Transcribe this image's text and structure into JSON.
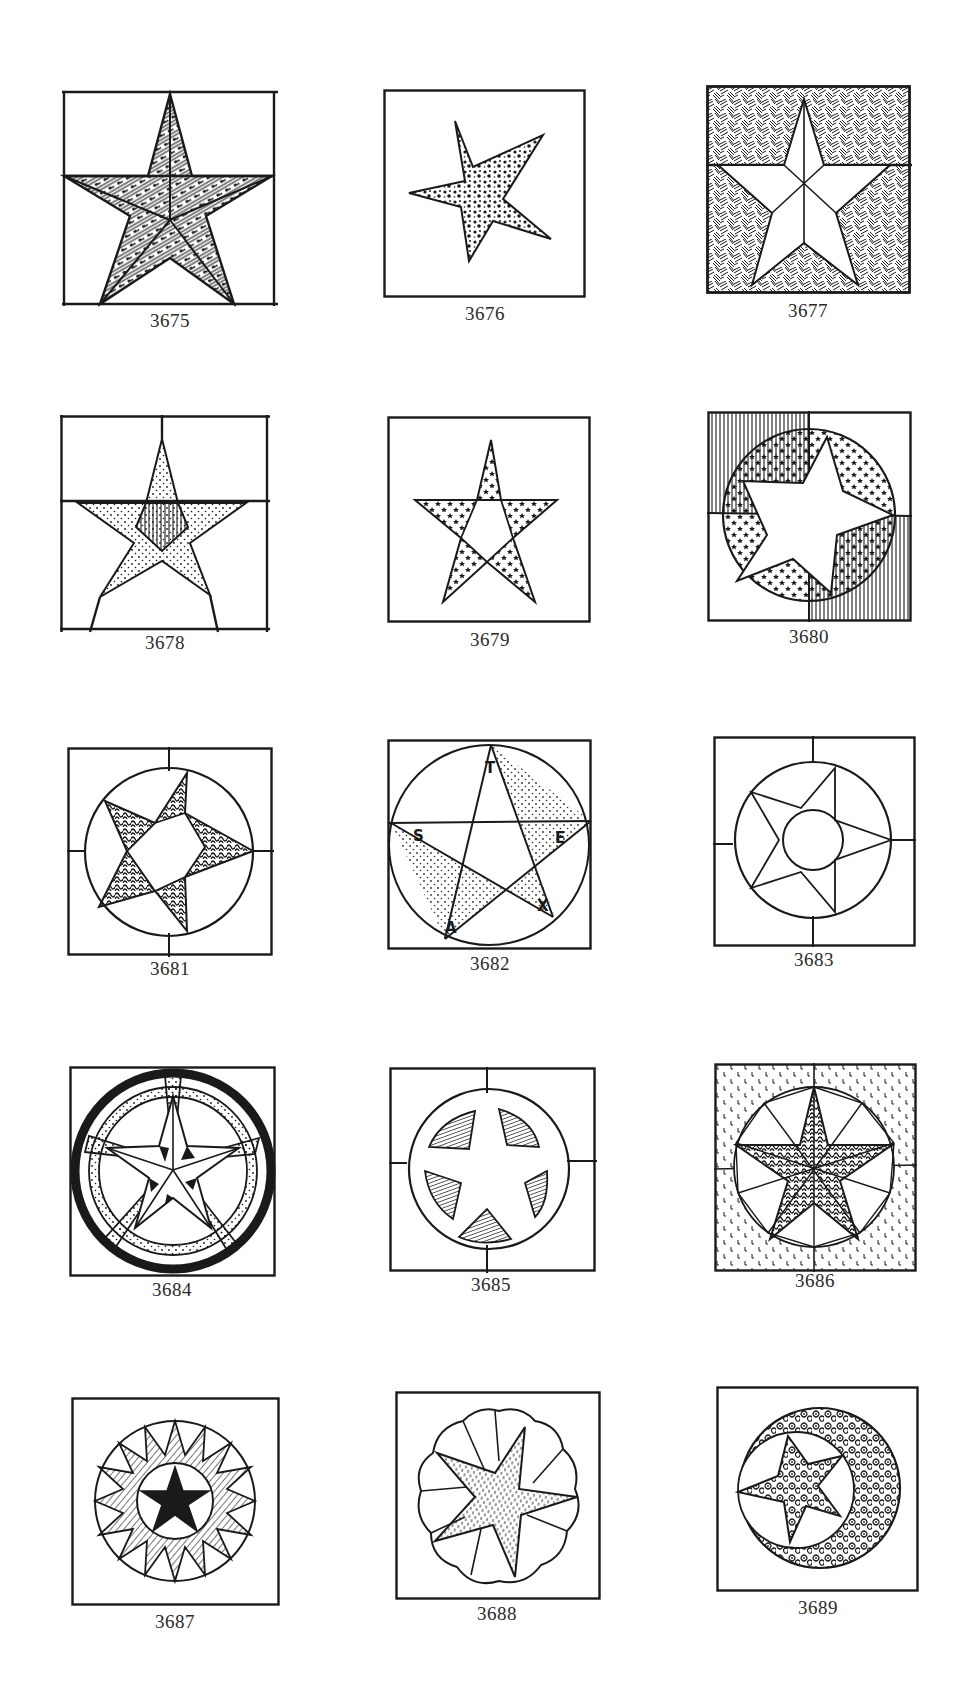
{
  "page": {
    "ink_color": "#1a1a1a",
    "paper_color": "#ffffff"
  },
  "figures": [
    {
      "number": "3675",
      "motif": "five-point star, patterned stripe diamonds, split background"
    },
    {
      "number": "3676",
      "motif": "tilted five-point star with mottled fill"
    },
    {
      "number": "3677",
      "motif": "outlined star on hatched textured background"
    },
    {
      "number": "3678",
      "motif": "dotted star with hatched pentagon center"
    },
    {
      "number": "3679",
      "motif": "outlined star with dotted points"
    },
    {
      "number": "3680",
      "motif": "star in circle with speckled segments, striped corners"
    },
    {
      "number": "3681",
      "motif": "star in circle with swirl-patterned points"
    },
    {
      "number": "3682",
      "motif": "lettered pentagram in circle",
      "letters": [
        "T",
        "E",
        "X",
        "A",
        "S"
      ]
    },
    {
      "number": "3683",
      "motif": "star in circle with center circle"
    },
    {
      "number": "3684",
      "motif": "star in bold-ringed circle with dotted bands"
    },
    {
      "number": "3685",
      "motif": "star cut-out with hatched wedges in circle"
    },
    {
      "number": "3686",
      "motif": "zigzag star in circle, speckled background"
    },
    {
      "number": "3687",
      "motif": "radiating sunburst star in circle"
    },
    {
      "number": "3688",
      "motif": "dotted star in scalloped circle"
    },
    {
      "number": "3689",
      "motif": "star in circle with floral-patterned ring"
    }
  ]
}
